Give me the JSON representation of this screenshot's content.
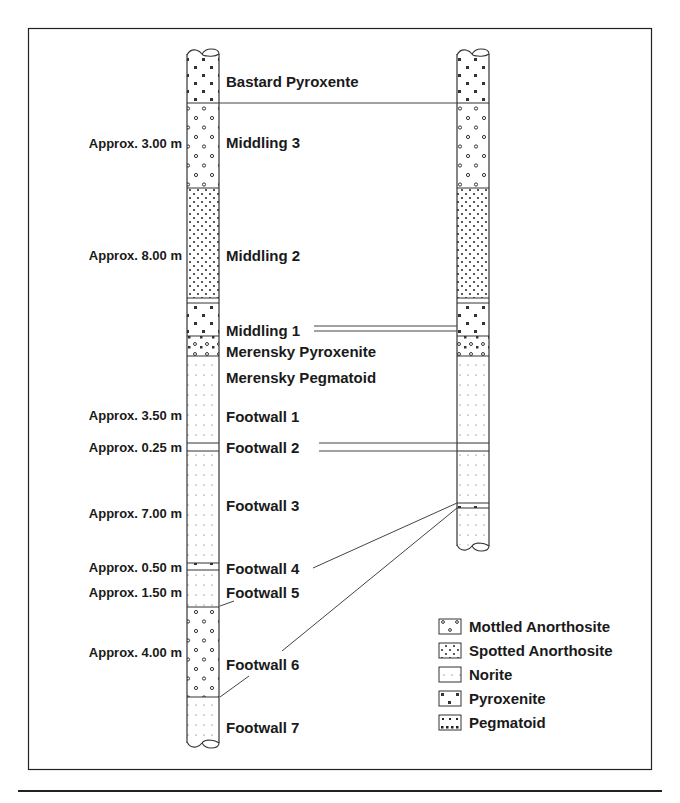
{
  "diagram": {
    "left_column": {
      "layers": [
        {
          "name": "Bastard Pyroxente",
          "thickness": "",
          "rock": "pyroxenite"
        },
        {
          "name": "Middling 3",
          "thickness": "Approx. 3.00 m",
          "rock": "mottled"
        },
        {
          "name": "Middling 2",
          "thickness": "Approx. 8.00 m",
          "rock": "spotted"
        },
        {
          "name": "Middling 1",
          "thickness": "",
          "rock": "norite"
        },
        {
          "name": "Merensky Pyroxenite",
          "thickness": "",
          "rock": "pyroxenite"
        },
        {
          "name": "Merensky Pegmatoid",
          "thickness": "",
          "rock": "pegmatoid"
        },
        {
          "name": "Footwall 1",
          "thickness": "Approx. 3.50 m",
          "rock": "norite"
        },
        {
          "name": "Footwall 2",
          "thickness": "Approx. 0.25 m",
          "rock": "norite"
        },
        {
          "name": "Footwall 3",
          "thickness": "Approx. 7.00 m",
          "rock": "norite"
        },
        {
          "name": "Footwall 4",
          "thickness": "Approx. 0.50 m",
          "rock": "pyroxenite"
        },
        {
          "name": "Footwall 5",
          "thickness": "Approx. 1.50 m",
          "rock": "norite"
        },
        {
          "name": "Footwall 6",
          "thickness": "Approx. 4.00 m",
          "rock": "mottled"
        },
        {
          "name": "Footwall 7",
          "thickness": "",
          "rock": "norite"
        }
      ]
    },
    "legend": {
      "items": [
        {
          "label": "Mottled Anorthosite",
          "rock": "mottled"
        },
        {
          "label": "Spotted Anorthosite",
          "rock": "spotted"
        },
        {
          "label": "Norite",
          "rock": "norite"
        },
        {
          "label": "Pyroxenite",
          "rock": "pyroxenite"
        },
        {
          "label": "Pegmatoid",
          "rock": "pegmatoid"
        }
      ]
    },
    "colors": {
      "ink": "#1a1a1a",
      "line": "#444444",
      "background": "#ffffff"
    }
  }
}
